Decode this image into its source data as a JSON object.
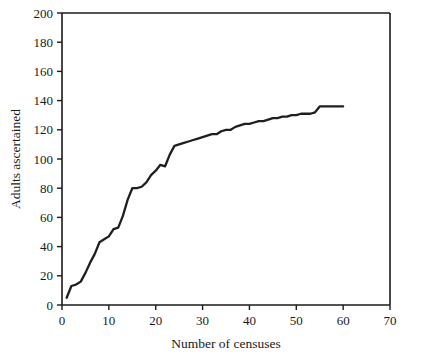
{
  "chart_data": {
    "type": "line",
    "title": "",
    "xlabel": "Number of censuses",
    "ylabel": "Adults ascertained",
    "xlim": [
      0,
      70
    ],
    "ylim": [
      0,
      200
    ],
    "xticks": [
      0,
      10,
      20,
      30,
      40,
      50,
      60,
      70
    ],
    "yticks": [
      0,
      20,
      40,
      60,
      80,
      100,
      120,
      140,
      160,
      180,
      200
    ],
    "xtick_labels": [
      "0",
      "10",
      "20",
      "30",
      "40",
      "50",
      "60",
      "70"
    ],
    "ytick_labels": [
      "0",
      "20",
      "40",
      "60",
      "80",
      "100",
      "120",
      "140",
      "160",
      "180",
      "200"
    ],
    "grid": false,
    "legend": null,
    "legend_position": "none",
    "line_color": "#1f1f1f",
    "background_color": "#ffffff",
    "axis_color": "#1a1a1a",
    "series": [
      {
        "name": "Cumulative adults ascertained",
        "x": [
          1,
          2,
          3,
          4,
          5,
          6,
          7,
          8,
          9,
          10,
          11,
          12,
          13,
          14,
          15,
          16,
          17,
          18,
          19,
          20,
          21,
          22,
          23,
          24,
          25,
          26,
          27,
          28,
          29,
          30,
          31,
          32,
          33,
          34,
          35,
          36,
          37,
          38,
          39,
          40,
          41,
          42,
          43,
          44,
          45,
          46,
          47,
          48,
          49,
          50,
          51,
          52,
          53,
          54,
          55,
          56,
          57,
          58,
          59,
          60
        ],
        "y": [
          5,
          13,
          14,
          16,
          22,
          29,
          35,
          43,
          45,
          47,
          52,
          53,
          61,
          72,
          80,
          80,
          81,
          84,
          89,
          92,
          96,
          95,
          103,
          109,
          110,
          111,
          112,
          113,
          114,
          115,
          116,
          117,
          117,
          119,
          120,
          120,
          122,
          123,
          124,
          124,
          125,
          126,
          126,
          127,
          128,
          128,
          129,
          129,
          130,
          130,
          131,
          131,
          131,
          132,
          136,
          136,
          136,
          136,
          136,
          136
        ]
      }
    ]
  }
}
